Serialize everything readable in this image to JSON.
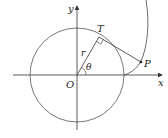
{
  "diagram": {
    "labels": {
      "y_axis": "y",
      "x_axis": "x",
      "origin": "O",
      "tangent_point": "T",
      "point": "P",
      "radius": "r",
      "angle": "θ"
    },
    "colors": {
      "stroke": "#333333",
      "background": "#ffffff"
    }
  }
}
